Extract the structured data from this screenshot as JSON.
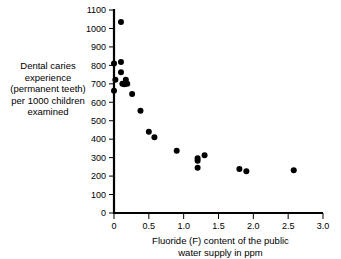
{
  "chart_data": {
    "type": "scatter",
    "title": "",
    "xlabel": "Fluoride (F) content of the public water supply in ppm",
    "xlabel_line1": "Fluoride (F) content of the public",
    "xlabel_line2": "water supply in ppm",
    "ylabel": "Dental caries experience (permanent teeth) per 1000 children examined",
    "ylabel_lines": [
      "Dental caries",
      "experience",
      "(permanent teeth)",
      "per 1000 children",
      "examined"
    ],
    "xlim": [
      0,
      3.0
    ],
    "ylim": [
      0,
      1100
    ],
    "xticks": [
      0,
      0.5,
      1.0,
      1.5,
      2.0,
      2.5,
      3.0
    ],
    "xtick_labels": [
      "0",
      "0.5",
      "1.0",
      "1.5",
      "2.0",
      "2.5",
      "3.0"
    ],
    "yticks": [
      0,
      100,
      200,
      300,
      400,
      500,
      600,
      700,
      800,
      900,
      1000,
      1100
    ],
    "ytick_labels": [
      "0",
      "100",
      "200",
      "300",
      "400",
      "500",
      "600",
      "700",
      "800",
      "900",
      "1000",
      "1100"
    ],
    "grid": false,
    "legend": null,
    "marker_color": "#000000",
    "marker_size": 3.0,
    "points": [
      {
        "x": 0.1,
        "y": 1035
      },
      {
        "x": 0.0,
        "y": 810
      },
      {
        "x": 0.1,
        "y": 818
      },
      {
        "x": 0.1,
        "y": 763
      },
      {
        "x": 0.02,
        "y": 722
      },
      {
        "x": 0.12,
        "y": 700
      },
      {
        "x": 0.17,
        "y": 722
      },
      {
        "x": 0.19,
        "y": 700
      },
      {
        "x": 0.15,
        "y": 697
      },
      {
        "x": 0.0,
        "y": 662
      },
      {
        "x": 0.26,
        "y": 645
      },
      {
        "x": 0.38,
        "y": 554
      },
      {
        "x": 0.5,
        "y": 440
      },
      {
        "x": 0.58,
        "y": 410
      },
      {
        "x": 0.9,
        "y": 337
      },
      {
        "x": 1.2,
        "y": 296
      },
      {
        "x": 1.2,
        "y": 283
      },
      {
        "x": 1.3,
        "y": 313
      },
      {
        "x": 1.2,
        "y": 245
      },
      {
        "x": 1.8,
        "y": 238
      },
      {
        "x": 1.9,
        "y": 226
      },
      {
        "x": 2.58,
        "y": 232
      }
    ]
  }
}
